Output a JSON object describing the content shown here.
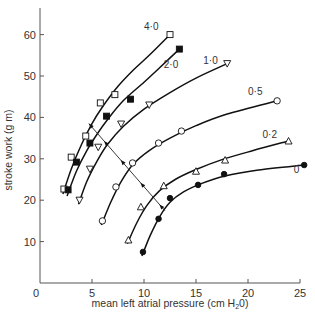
{
  "chart_data": {
    "type": "scatter",
    "title": "",
    "xlabel": "mean left atrial pressure (cm H₂0)",
    "xlabel_main": "mean left atrial pressure (cm H",
    "xlabel_sub": "2",
    "xlabel_end": "0)",
    "ylabel": "stroke work (g m)",
    "xlim": [
      0,
      25
    ],
    "ylim": [
      0,
      65
    ],
    "xticks": [
      0,
      5,
      10,
      15,
      20,
      25
    ],
    "xtick_labels": [
      "0",
      "5",
      "10",
      "15",
      "20",
      "25"
    ],
    "yticks": [
      10,
      20,
      30,
      40,
      50,
      60
    ],
    "ytick_labels": [
      "10",
      "20",
      "30",
      "40",
      "50",
      "60"
    ],
    "grid": false,
    "legend": "inline curve labels",
    "series": [
      {
        "name": "4·0",
        "marker": "open-square",
        "points": [
          [
            2.3,
            22.7
          ],
          [
            3.0,
            30.4
          ],
          [
            4.4,
            35.5
          ],
          [
            5.8,
            43.5
          ],
          [
            7.2,
            45.5
          ],
          [
            12.5,
            60.0
          ]
        ],
        "curve": [
          [
            2.2,
            21.5
          ],
          [
            3.0,
            27.5
          ],
          [
            4.0,
            33.5
          ],
          [
            5.0,
            38.5
          ],
          [
            6.0,
            42.5
          ],
          [
            7.5,
            47.5
          ],
          [
            9.0,
            51.5
          ],
          [
            10.5,
            55.0
          ],
          [
            12.5,
            60.0
          ]
        ]
      },
      {
        "name": "2·0",
        "marker": "filled-square",
        "points": [
          [
            2.7,
            22.5
          ],
          [
            3.5,
            29.2
          ],
          [
            4.8,
            33.8
          ],
          [
            6.4,
            40.3
          ],
          [
            8.7,
            44.4
          ],
          [
            13.4,
            56.5
          ]
        ],
        "curve": [
          [
            2.6,
            21.0
          ],
          [
            3.5,
            27.0
          ],
          [
            4.5,
            32.0
          ],
          [
            5.5,
            36.0
          ],
          [
            6.5,
            39.5
          ],
          [
            8.0,
            44.0
          ],
          [
            10.0,
            48.5
          ],
          [
            11.5,
            52.0
          ],
          [
            13.4,
            56.5
          ]
        ]
      },
      {
        "name": "1·0",
        "marker": "open-triangle-down",
        "points": [
          [
            3.8,
            20.0
          ],
          [
            4.8,
            27.5
          ],
          [
            5.6,
            32.8
          ],
          [
            7.8,
            38.4
          ],
          [
            10.5,
            43.0
          ],
          [
            18.0,
            53.0
          ]
        ],
        "curve": [
          [
            3.7,
            19.0
          ],
          [
            4.5,
            24.5
          ],
          [
            5.5,
            29.5
          ],
          [
            6.5,
            33.5
          ],
          [
            8.0,
            37.8
          ],
          [
            10.0,
            42.0
          ],
          [
            12.5,
            46.0
          ],
          [
            15.0,
            49.5
          ],
          [
            18.0,
            53.0
          ]
        ]
      },
      {
        "name": "0·5",
        "marker": "open-circle",
        "points": [
          [
            6.0,
            15.0
          ],
          [
            7.3,
            23.2
          ],
          [
            8.9,
            29.0
          ],
          [
            11.4,
            33.8
          ],
          [
            13.6,
            36.7
          ],
          [
            22.8,
            44.0
          ]
        ],
        "curve": [
          [
            5.9,
            14.0
          ],
          [
            6.8,
            19.5
          ],
          [
            7.8,
            24.5
          ],
          [
            9.0,
            28.8
          ],
          [
            10.5,
            32.0
          ],
          [
            12.5,
            35.0
          ],
          [
            15.0,
            38.0
          ],
          [
            18.0,
            40.8
          ],
          [
            22.8,
            44.0
          ]
        ]
      },
      {
        "name": "0·2",
        "marker": "open-triangle-up",
        "points": [
          [
            8.5,
            10.4
          ],
          [
            9.7,
            18.4
          ],
          [
            11.9,
            23.5
          ],
          [
            15.0,
            27.0
          ],
          [
            17.8,
            29.7
          ],
          [
            23.9,
            34.3
          ]
        ],
        "curve": [
          [
            8.4,
            9.5
          ],
          [
            9.3,
            14.5
          ],
          [
            10.3,
            18.8
          ],
          [
            11.5,
            22.3
          ],
          [
            13.0,
            25.0
          ],
          [
            15.0,
            27.4
          ],
          [
            17.5,
            29.8
          ],
          [
            20.5,
            32.0
          ],
          [
            23.9,
            34.3
          ]
        ]
      },
      {
        "name": "0",
        "marker": "filled-circle",
        "points": [
          [
            9.9,
            7.5
          ],
          [
            11.4,
            15.5
          ],
          [
            12.5,
            20.5
          ],
          [
            15.2,
            23.7
          ],
          [
            17.7,
            26.3
          ],
          [
            25.4,
            28.5
          ]
        ],
        "curve": [
          [
            9.8,
            6.5
          ],
          [
            10.6,
            11.5
          ],
          [
            11.5,
            16.0
          ],
          [
            12.5,
            19.5
          ],
          [
            13.8,
            22.0
          ],
          [
            15.5,
            24.0
          ],
          [
            17.7,
            25.8
          ],
          [
            21.0,
            27.3
          ],
          [
            25.4,
            28.5
          ]
        ]
      }
    ],
    "annotations": [
      {
        "type": "arrow-line",
        "from": [
          4.7,
          38.5
        ],
        "to": [
          12.0,
          17.5
        ],
        "note": "double-headed line crossing curves with arrow markers"
      }
    ],
    "series_label_positions": [
      {
        "name": "4·0",
        "x": 10.0,
        "y": 61.0
      },
      {
        "name": "2·0",
        "x": 11.9,
        "y": 52.0
      },
      {
        "name": "1·0",
        "x": 15.7,
        "y": 53.0
      },
      {
        "name": "0·5",
        "x": 20.0,
        "y": 45.5
      },
      {
        "name": "0·2",
        "x": 21.4,
        "y": 35.0
      },
      {
        "name": "0",
        "x": 24.4,
        "y": 26.5
      }
    ]
  }
}
